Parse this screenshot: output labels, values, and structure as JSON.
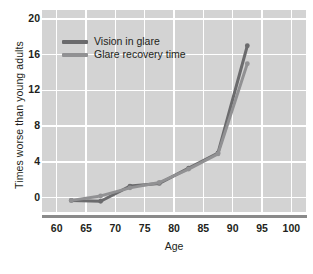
{
  "chart_data": {
    "type": "line",
    "title": "",
    "xlabel": "Age",
    "ylabel": "Times worse than young adults",
    "xlim": [
      57.5,
      102.5
    ],
    "ylim": [
      -1.6,
      21.0
    ],
    "xticks": [
      60,
      65,
      70,
      75,
      80,
      85,
      90,
      95,
      100
    ],
    "xtick_labels": [
      "60",
      "65",
      "70",
      "75",
      "80",
      "85",
      "90",
      "95",
      "100"
    ],
    "yticks": [
      0,
      4,
      8,
      12,
      16,
      20
    ],
    "ytick_labels": [
      "0",
      "4",
      "8",
      "12",
      "16",
      "20"
    ],
    "grid": true,
    "grid_color": "#ffffff",
    "plot_background": "#d3d3d3",
    "legend_position": "upper-left-inside",
    "x": [
      62.5,
      67.5,
      72.5,
      77.5,
      82.5,
      87.5,
      92.5
    ],
    "series": [
      {
        "name": "Vision in glare",
        "color": "#6b6b6d",
        "values": [
          -0.3,
          -0.4,
          1.3,
          1.6,
          3.3,
          5.0,
          17.0
        ]
      },
      {
        "name": "Glare recovery time",
        "color": "#919193",
        "values": [
          -0.3,
          0.2,
          1.1,
          1.7,
          3.2,
          4.9,
          15.0
        ]
      }
    ]
  },
  "legend": {
    "items": [
      {
        "label": "Vision in glare",
        "color": "#6b6b6d"
      },
      {
        "label": "Glare recovery time",
        "color": "#919193"
      }
    ]
  }
}
